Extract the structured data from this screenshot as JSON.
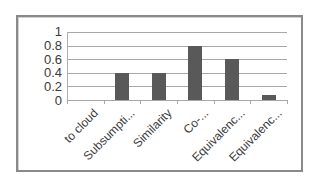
{
  "chart_data": {
    "type": "bar",
    "title": "",
    "xlabel": "",
    "ylabel": "",
    "categories": [
      "to cloud",
      "Subsumpti...",
      "Similarity",
      "Co-...",
      "Equivalenc...",
      "Equivalenc..."
    ],
    "values": [
      0,
      0.4,
      0.4,
      0.8,
      0.6,
      0.08
    ],
    "ylim": [
      0,
      1
    ],
    "yticks": [
      "1",
      "0.8",
      "0.6",
      "0.4",
      "0.2",
      "0"
    ],
    "grid": true,
    "legend": null,
    "bar_color": "#595959"
  }
}
